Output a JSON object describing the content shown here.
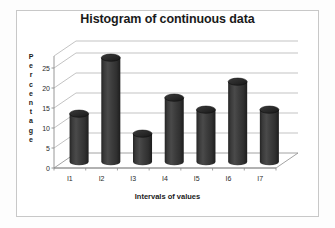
{
  "chart_data": {
    "type": "bar",
    "title": "Histogram of continuous data",
    "xlabel": "Intervals of values",
    "ylabel": "Percentage",
    "categories": [
      "I1",
      "I2",
      "I3",
      "I4",
      "I5",
      "I6",
      "I7"
    ],
    "values": [
      12,
      26,
      7,
      16,
      13,
      20,
      13
    ],
    "yticks": [
      0,
      5,
      10,
      15,
      20,
      25
    ],
    "ylim": [
      0,
      28
    ],
    "grid": true,
    "legend": false,
    "style": "3d-cylinder",
    "colors": {
      "bar_fill": "#3c3c3c",
      "bar_shadow": "#1e1e1e",
      "bar_highlight": "#555555",
      "bar_top": "#2a2a2a",
      "grid": "#b4b4b4",
      "axis": "#8c8c8c",
      "frame": "#c8c8c8",
      "background": "#ffffff",
      "text": "#1a1a1a"
    }
  },
  "ylabel_letters": [
    "P",
    "e",
    "r",
    "c",
    "e",
    "n",
    "t",
    "a",
    "g",
    "e"
  ]
}
